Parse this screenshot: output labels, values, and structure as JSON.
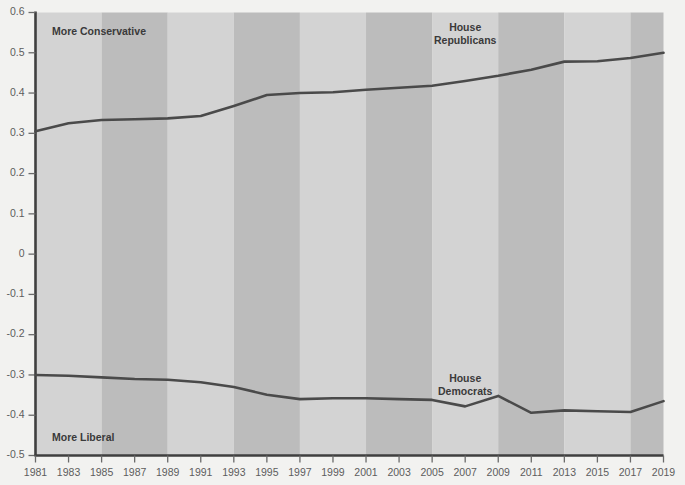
{
  "chart_data": {
    "type": "line",
    "title": "",
    "subtitle": "",
    "xlabel": "",
    "ylabel": "",
    "x": [
      1981,
      1983,
      1985,
      1987,
      1989,
      1991,
      1993,
      1995,
      1997,
      1999,
      2001,
      2003,
      2005,
      2007,
      2009,
      2011,
      2013,
      2015,
      2017,
      2019
    ],
    "tick_labels_x": [
      "1981",
      "1983",
      "1985",
      "1987",
      "1989",
      "1991",
      "1993",
      "1995",
      "1997",
      "1999",
      "2001",
      "2003",
      "2005",
      "2007",
      "2009",
      "2011",
      "2013",
      "2015",
      "2017",
      "2019"
    ],
    "tick_labels_y": [
      "0.6",
      "0.5",
      "0.4",
      "0.3",
      "0.2",
      "0.1",
      "0",
      "-0.1",
      "-0.2",
      "-0.3",
      "-0.4",
      "-0.5"
    ],
    "tick_values_y": [
      0.6,
      0.5,
      0.4,
      0.3,
      0.2,
      0.1,
      0,
      -0.1,
      -0.2,
      -0.3,
      -0.4,
      -0.5
    ],
    "xlim": [
      1981,
      2019
    ],
    "ylim": [
      -0.5,
      0.6
    ],
    "grid": false,
    "legend_position": "inline-annotation",
    "series": [
      {
        "name": "House Republicans",
        "color": "#4a4a4a",
        "label_x": 2007,
        "label_y": 0.555,
        "values": [
          0.305,
          0.325,
          0.333,
          0.335,
          0.337,
          0.343,
          0.368,
          0.395,
          0.4,
          0.402,
          0.408,
          0.413,
          0.418,
          0.43,
          0.443,
          0.458,
          0.478,
          0.479,
          0.487,
          0.5
        ]
      },
      {
        "name": "House Democrats",
        "color": "#4a4a4a",
        "label_x": 2007,
        "label_y": -0.318,
        "values": [
          -0.3,
          -0.302,
          -0.306,
          -0.31,
          -0.312,
          -0.318,
          -0.33,
          -0.349,
          -0.36,
          -0.358,
          -0.358,
          -0.36,
          -0.362,
          -0.378,
          -0.352,
          -0.394,
          -0.388,
          -0.39,
          -0.392,
          -0.365
        ]
      }
    ],
    "annotations": [
      {
        "text": "More Conservative",
        "x": 1982,
        "y": 0.552
      },
      {
        "text": "More Liberal",
        "x": 1982,
        "y": -0.456
      }
    ],
    "bands": {
      "light_color": "#d3d3d3",
      "dark_color": "#bcbcbc",
      "period_years": 4,
      "ranges": [
        {
          "from": 1981,
          "to": 1985,
          "shade": "light"
        },
        {
          "from": 1985,
          "to": 1989,
          "shade": "dark"
        },
        {
          "from": 1989,
          "to": 1993,
          "shade": "light"
        },
        {
          "from": 1993,
          "to": 1997,
          "shade": "dark"
        },
        {
          "from": 1997,
          "to": 2001,
          "shade": "light"
        },
        {
          "from": 2001,
          "to": 2005,
          "shade": "dark"
        },
        {
          "from": 2005,
          "to": 2009,
          "shade": "light"
        },
        {
          "from": 2009,
          "to": 2013,
          "shade": "dark"
        },
        {
          "from": 2013,
          "to": 2017,
          "shade": "light"
        },
        {
          "from": 2017,
          "to": 2021,
          "shade": "dark"
        }
      ]
    },
    "colors": {
      "page_background": "#f2f2f0",
      "axis": "#3f3f3f",
      "tick": "#6a6a6a",
      "tick_label": "#5d5d5d",
      "annotation": "#3a3a3a",
      "line": "#4a4a4a"
    }
  }
}
